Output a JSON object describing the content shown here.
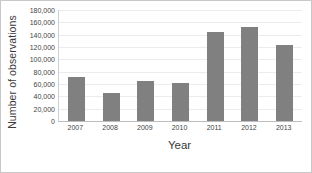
{
  "chart_data": {
    "type": "bar",
    "title": "",
    "xlabel": "Year",
    "ylabel": "Number of observations",
    "categories": [
      "2007",
      "2008",
      "2009",
      "2010",
      "2011",
      "2012",
      "2013"
    ],
    "values": [
      72000,
      45000,
      65000,
      62000,
      145000,
      152000,
      123000
    ],
    "ylim": [
      0,
      180000
    ],
    "ytick_step": 20000,
    "ytick_labels": [
      "180,000",
      "160,000",
      "140,000",
      "120,000",
      "100,000",
      "80,000",
      "60,000",
      "40,000",
      "20,000",
      "0"
    ],
    "grid": true,
    "legend": false,
    "bar_color": "#808080",
    "gridline_color": "#ECECED",
    "frame_color": "#C8C8C8",
    "background": "#FFFFFF"
  }
}
